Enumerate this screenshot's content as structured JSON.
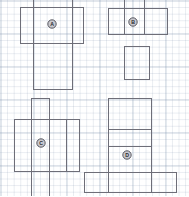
{
  "figure": {
    "title": "Polyomino net diagrams on graph paper",
    "background_color": "#ffffff",
    "grid": {
      "visible": true,
      "minor_cell_px": 6.6,
      "major_cell_px": 33,
      "minor_color": "#8a9cb4",
      "major_color": "#7a8ca8"
    },
    "stroke_color": "#6e6e78",
    "marker_fill_color": "#c9c9cf",
    "marker_stroke_color": "#4a4a52",
    "marker_text_color": "#2b2b30"
  },
  "nets": [
    {
      "id": "net-a",
      "label": "A",
      "label_position": {
        "x": 52,
        "y": 24
      },
      "rects": [
        {
          "name": "top-face",
          "x": 33,
          "y": -7,
          "w": 39,
          "h": 14
        },
        {
          "name": "left-face",
          "x": 20,
          "y": 7,
          "w": 13,
          "h": 36
        },
        {
          "name": "center-face",
          "x": 33,
          "y": 7,
          "w": 39,
          "h": 36
        },
        {
          "name": "right-face",
          "x": 72,
          "y": 7,
          "w": 11,
          "h": 36
        },
        {
          "name": "bottom-face",
          "x": 33,
          "y": 43,
          "w": 39,
          "h": 46
        }
      ]
    },
    {
      "id": "net-b",
      "label": "B",
      "label_position": {
        "x": 133,
        "y": 22
      },
      "rects": [
        {
          "name": "top-face",
          "x": 124,
          "y": -7,
          "w": 20,
          "h": 15
        },
        {
          "name": "left-face",
          "x": 108,
          "y": 8,
          "w": 16,
          "h": 26
        },
        {
          "name": "center-face",
          "x": 124,
          "y": 8,
          "w": 20,
          "h": 26
        },
        {
          "name": "right-face",
          "x": 144,
          "y": 8,
          "w": 23,
          "h": 26
        },
        {
          "name": "bottom-face",
          "x": 124,
          "y": 46,
          "w": 25,
          "h": 33
        }
      ]
    },
    {
      "id": "net-c",
      "label": "C",
      "label_position": {
        "x": 41,
        "y": 143
      },
      "rects": [
        {
          "name": "top-face",
          "x": 31,
          "y": 98,
          "w": 18,
          "h": 21
        },
        {
          "name": "left-face",
          "x": 14,
          "y": 119,
          "w": 17,
          "h": 52
        },
        {
          "name": "center-face",
          "x": 31,
          "y": 119,
          "w": 18,
          "h": 52
        },
        {
          "name": "right-face",
          "x": 49,
          "y": 119,
          "w": 17,
          "h": 52
        },
        {
          "name": "far-face",
          "x": 66,
          "y": 119,
          "w": 13,
          "h": 52
        },
        {
          "name": "bottom-face",
          "x": 31,
          "y": 171,
          "w": 18,
          "h": 25
        }
      ]
    },
    {
      "id": "net-d",
      "label": "D",
      "label_position": {
        "x": 127,
        "y": 155
      },
      "rects": [
        {
          "name": "top-face",
          "x": 108,
          "y": 98,
          "w": 43,
          "h": 31
        },
        {
          "name": "middle-face",
          "x": 108,
          "y": 129,
          "w": 43,
          "h": 17
        },
        {
          "name": "center-face",
          "x": 108,
          "y": 146,
          "w": 43,
          "h": 26
        },
        {
          "name": "left-strip",
          "x": 84,
          "y": 172,
          "w": 24,
          "h": 20
        },
        {
          "name": "bottom-face",
          "x": 108,
          "y": 172,
          "w": 43,
          "h": 20
        },
        {
          "name": "right-strip",
          "x": 151,
          "y": 172,
          "w": 25,
          "h": 20
        }
      ]
    }
  ]
}
